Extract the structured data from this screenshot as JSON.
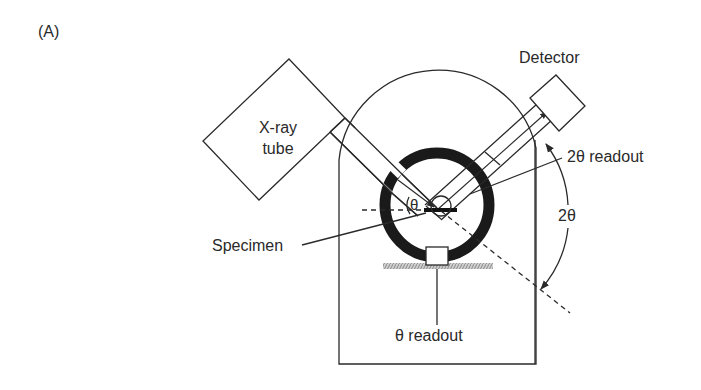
{
  "figure": {
    "panel_label": "(A)",
    "labels": {
      "xray_tube_line1": "X-ray",
      "xray_tube_line2": "tube",
      "detector": "Detector",
      "two_theta_readout": "2θ readout",
      "two_theta": "2θ",
      "theta": "θ",
      "specimen": "Specimen",
      "theta_readout": "θ readout"
    }
  }
}
